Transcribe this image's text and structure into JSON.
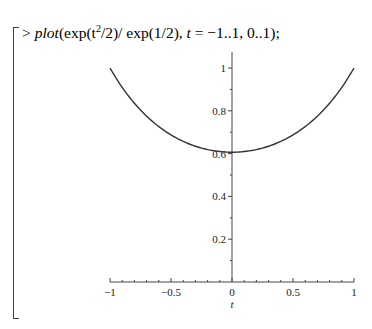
{
  "worksheet": {
    "prompt": ">",
    "command": "plot(exp(t^2/2)/exp(1/2), t = -1..1, 0..1);",
    "command_parts": {
      "fn": "plot",
      "expr_pre": "(exp(t",
      "exp": "2",
      "expr_post": "/2)/ exp(1/2), ",
      "var": "t",
      "range": " = −1..1, 0..1);"
    }
  },
  "chart_data": {
    "type": "line",
    "title": "",
    "xlabel": "t",
    "ylabel": "",
    "xlim": [
      -1,
      1
    ],
    "ylim": [
      0,
      1
    ],
    "grid": false,
    "x_ticks": [
      "-1",
      "-0.5",
      "0",
      "0.5",
      "1"
    ],
    "y_ticks": [
      "0.2",
      "0.4",
      "0.6",
      "0.8",
      "1"
    ],
    "series": [
      {
        "name": "exp(t^2/2)/exp(1/2)",
        "x": [
          -1,
          -0.75,
          -0.5,
          -0.25,
          0,
          0.25,
          0.5,
          0.75,
          1
        ],
        "y": [
          1.0,
          0.8395,
          0.6873,
          0.6268,
          0.6065,
          0.6268,
          0.6873,
          0.8395,
          1.0
        ]
      }
    ],
    "color": "#333333"
  }
}
